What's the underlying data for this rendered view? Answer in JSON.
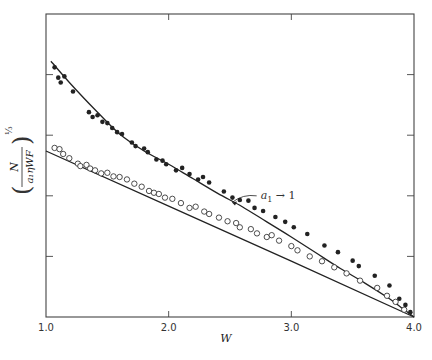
{
  "chart_data": {
    "type": "scatter",
    "title": "",
    "xlabel": "W",
    "ylabel": "(N / (a1 η W F))^(1/3)",
    "ylabel_parts": {
      "numerator": "N",
      "denominator": "a₁ηWF",
      "exponent": "⅓"
    },
    "xlim": [
      1.0,
      4.0
    ],
    "ylim": [
      0,
      5
    ],
    "x_ticks": [
      1.0,
      2.0,
      3.0,
      4.0
    ],
    "x_tick_labels": [
      "1.0",
      "2.0",
      "3.0",
      "4.0"
    ],
    "y_ticks": [
      1,
      2,
      3,
      4
    ],
    "y_tick_labels": [
      "",
      "",
      "",
      ""
    ],
    "grid": false,
    "legend": null,
    "annotations": [
      {
        "text": "a₁→ 1",
        "subscript_label": {
          "base": "a",
          "sub": "1",
          "arrow": "→",
          "value": "1"
        },
        "x": 2.75,
        "y": 1.95,
        "points_to": {
          "x": 2.5,
          "y": 1.84
        }
      }
    ],
    "series": [
      {
        "name": "a1 -> 1 (filled circles)",
        "marker": "filled-circle",
        "curve": {
          "x": [
            1.04,
            1.2,
            1.4,
            1.6,
            1.8,
            2.0,
            2.2,
            2.4,
            2.6,
            2.8,
            3.0,
            3.2,
            3.4,
            3.6,
            3.8,
            3.9,
            4.0
          ],
          "y": [
            4.22,
            3.85,
            3.42,
            3.02,
            2.74,
            2.52,
            2.28,
            2.04,
            1.82,
            1.57,
            1.32,
            1.06,
            0.8,
            0.56,
            0.3,
            0.15,
            0.0
          ]
        },
        "points": {
          "x": [
            1.07,
            1.1,
            1.12,
            1.15,
            1.22,
            1.35,
            1.38,
            1.42,
            1.46,
            1.5,
            1.54,
            1.58,
            1.62,
            1.7,
            1.73,
            1.8,
            1.83,
            1.9,
            1.95,
            1.98,
            2.06,
            2.11,
            2.17,
            2.24,
            2.28,
            2.33,
            2.45,
            2.52,
            2.58,
            2.65,
            2.7,
            2.77,
            2.87,
            2.95,
            3.02,
            3.13,
            3.27,
            3.38,
            3.5,
            3.55,
            3.68,
            3.8,
            3.88,
            3.93,
            3.97
          ],
          "y": [
            4.12,
            3.95,
            3.87,
            3.97,
            3.72,
            3.38,
            3.3,
            3.33,
            3.22,
            3.2,
            3.12,
            3.05,
            3.02,
            2.88,
            2.82,
            2.78,
            2.72,
            2.6,
            2.58,
            2.52,
            2.42,
            2.46,
            2.36,
            2.27,
            2.31,
            2.22,
            2.07,
            1.97,
            1.93,
            1.92,
            1.8,
            1.75,
            1.65,
            1.57,
            1.48,
            1.37,
            1.18,
            1.07,
            0.93,
            0.84,
            0.68,
            0.52,
            0.3,
            0.2,
            0.08
          ]
        }
      },
      {
        "name": "open circles",
        "marker": "open-circle",
        "curve": {
          "x": [
            1.0,
            2.0,
            3.0,
            4.0
          ],
          "y": [
            2.74,
            1.83,
            0.92,
            0.0
          ]
        },
        "points": {
          "x": [
            1.07,
            1.11,
            1.14,
            1.19,
            1.26,
            1.28,
            1.33,
            1.36,
            1.4,
            1.45,
            1.5,
            1.55,
            1.6,
            1.66,
            1.72,
            1.78,
            1.84,
            1.88,
            1.92,
            1.97,
            2.03,
            2.1,
            2.17,
            2.22,
            2.29,
            2.33,
            2.41,
            2.48,
            2.55,
            2.58,
            2.67,
            2.72,
            2.8,
            2.84,
            2.9,
            3.0,
            3.05,
            3.15,
            3.25,
            3.35,
            3.45,
            3.56,
            3.7,
            3.78,
            3.85,
            3.92
          ],
          "y": [
            2.79,
            2.77,
            2.69,
            2.62,
            2.53,
            2.49,
            2.51,
            2.45,
            2.42,
            2.37,
            2.38,
            2.32,
            2.31,
            2.27,
            2.2,
            2.15,
            2.08,
            2.05,
            2.03,
            1.97,
            1.95,
            1.88,
            1.8,
            1.82,
            1.74,
            1.7,
            1.64,
            1.58,
            1.55,
            1.48,
            1.45,
            1.38,
            1.32,
            1.35,
            1.26,
            1.17,
            1.1,
            1.0,
            0.92,
            0.82,
            0.72,
            0.6,
            0.48,
            0.35,
            0.25,
            0.12
          ]
        }
      }
    ]
  },
  "plot_frame": {
    "left": 46,
    "top": 14,
    "right": 414,
    "bottom": 317
  },
  "colors": {
    "ink": "#222222",
    "frame": "#444444",
    "background": "#ffffff"
  }
}
